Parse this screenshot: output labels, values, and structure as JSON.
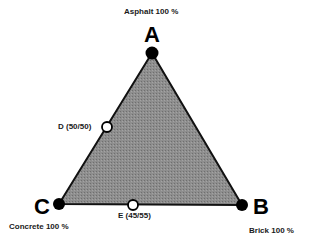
{
  "diagram": {
    "type": "ternary-triangle",
    "fill_color": "#8a8a8a",
    "edge_color": "#111111",
    "vertices": [
      {
        "id": "A",
        "letter": "A",
        "label": "Asphalt 100 %",
        "x": 152,
        "y": 53
      },
      {
        "id": "B",
        "letter": "B",
        "label": "Brick 100 %",
        "x": 242,
        "y": 205
      },
      {
        "id": "C",
        "letter": "C",
        "label": "Concrete 100 %",
        "x": 59,
        "y": 204
      }
    ],
    "points": [
      {
        "id": "D",
        "label": "D (50/50)",
        "x": 107,
        "y": 127,
        "edge": "A-C"
      },
      {
        "id": "E",
        "label": "E (45/55)",
        "x": 133,
        "y": 205,
        "edge": "C-B"
      }
    ]
  }
}
